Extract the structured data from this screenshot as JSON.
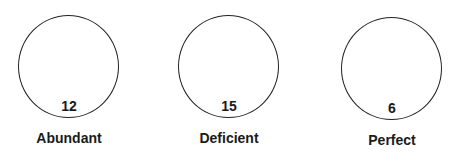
{
  "diagram": {
    "items": [
      {
        "number": "12",
        "label": "Abundant"
      },
      {
        "number": "15",
        "label": "Deficient"
      },
      {
        "number": "6",
        "label": "Perfect"
      }
    ]
  }
}
